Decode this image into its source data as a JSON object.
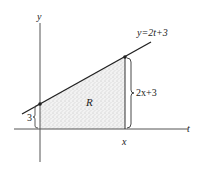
{
  "diagram": {
    "axes": {
      "vertical_label": "y",
      "horizontal_label": "t"
    },
    "line": {
      "equation": "y=2t+3"
    },
    "region": {
      "label": "R"
    },
    "annotations": {
      "intercept_height": "3",
      "right_height": "2x+3",
      "x_marker": "x"
    },
    "colors": {
      "ink": "#222222",
      "shade": "#d8d8d8",
      "background": "#ffffff"
    }
  }
}
